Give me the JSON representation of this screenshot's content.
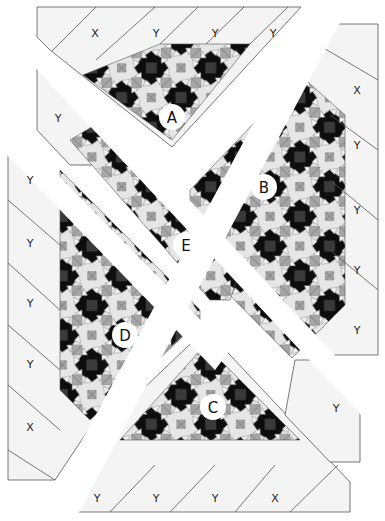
{
  "diagram": {
    "colors": {
      "background": "#ffffff",
      "setting_fabric": "#f4f4f4",
      "outline": "#555555",
      "block_black": "#0d0d0d",
      "block_dark_center": "#3a3a3a",
      "block_gray": "#a6a6a6",
      "block_light": "#e6e6e6",
      "label_circle": "#ffffff"
    },
    "section_labels": [
      {
        "id": "A",
        "label": "A",
        "x": 172,
        "y": 117
      },
      {
        "id": "B",
        "label": "B",
        "x": 264,
        "y": 187
      },
      {
        "id": "E",
        "label": "E",
        "x": 186,
        "y": 245
      },
      {
        "id": "D",
        "label": "D",
        "x": 125,
        "y": 335
      },
      {
        "id": "C",
        "label": "C",
        "x": 213,
        "y": 407
      }
    ],
    "setting_piece_labels": {
      "top": [
        {
          "label": "X",
          "x": 95,
          "y": 33
        },
        {
          "label": "Y",
          "x": 156,
          "y": 33
        },
        {
          "label": "Y",
          "x": 215,
          "y": 33
        },
        {
          "label": "Y",
          "x": 273,
          "y": 33
        }
      ],
      "upper_left": [
        {
          "label": "Y",
          "x": 58,
          "y": 118
        }
      ],
      "right": [
        {
          "label": "X",
          "x": 357,
          "y": 90
        },
        {
          "label": "Y",
          "x": 357,
          "y": 145
        },
        {
          "label": "Y",
          "x": 357,
          "y": 210
        },
        {
          "label": "Y",
          "x": 357,
          "y": 270
        },
        {
          "label": "Y",
          "x": 357,
          "y": 330
        }
      ],
      "lower_right": [
        {
          "label": "Y",
          "x": 336,
          "y": 408
        }
      ],
      "left": [
        {
          "label": "Y",
          "x": 30,
          "y": 180
        },
        {
          "label": "Y",
          "x": 30,
          "y": 243
        },
        {
          "label": "Y",
          "x": 30,
          "y": 303
        },
        {
          "label": "Y",
          "x": 30,
          "y": 364
        },
        {
          "label": "X",
          "x": 30,
          "y": 427
        }
      ],
      "bottom": [
        {
          "label": "Y",
          "x": 97,
          "y": 498
        },
        {
          "label": "Y",
          "x": 156,
          "y": 498
        },
        {
          "label": "Y",
          "x": 215,
          "y": 498
        },
        {
          "label": "X",
          "x": 275,
          "y": 498
        }
      ]
    }
  }
}
